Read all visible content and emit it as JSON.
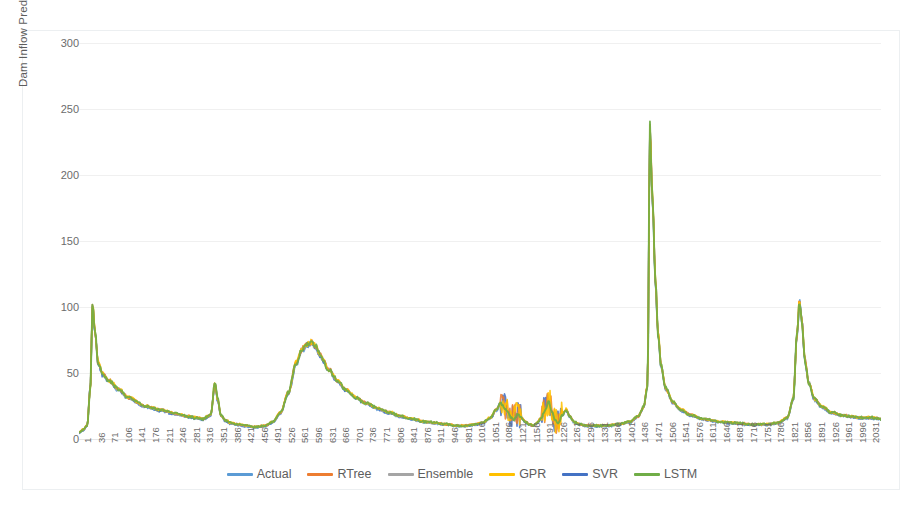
{
  "chart_data": {
    "type": "line",
    "title": "",
    "xlabel": "",
    "ylabel": "Dam Inflow Prediction (cubic meter /s)",
    "ylim": [
      0,
      300
    ],
    "yticks": [
      0,
      50,
      100,
      150,
      200,
      250,
      300
    ],
    "grid": true,
    "legend_position": "bottom",
    "xlim": [
      1,
      2066
    ],
    "xtick_step": 35,
    "xticks": [
      1,
      36,
      71,
      106,
      141,
      176,
      211,
      246,
      281,
      316,
      351,
      386,
      421,
      456,
      491,
      526,
      561,
      596,
      631,
      666,
      701,
      736,
      771,
      806,
      841,
      876,
      911,
      946,
      981,
      1016,
      1051,
      1086,
      1121,
      1156,
      1191,
      1226,
      1261,
      1296,
      1331,
      1366,
      1401,
      1436,
      1471,
      1506,
      1541,
      1576,
      1611,
      1646,
      1681,
      1716,
      1751,
      1786,
      1821,
      1856,
      1891,
      1926,
      1961,
      1996,
      2031
    ],
    "series": [
      {
        "name": "Actual",
        "color": "#5B9BD5"
      },
      {
        "name": "RTree",
        "color": "#ED7D31"
      },
      {
        "name": "Ensemble",
        "color": "#A5A5A5"
      },
      {
        "name": "GPR",
        "color": "#FFC000"
      },
      {
        "name": "SVR",
        "color": "#4472C4"
      },
      {
        "name": "LSTM",
        "color": "#70AD47"
      }
    ],
    "control_points": {
      "x": [
        1,
        12,
        22,
        30,
        36,
        42,
        50,
        62,
        80,
        100,
        130,
        170,
        210,
        250,
        281,
        300,
        320,
        340,
        351,
        358,
        366,
        378,
        392,
        410,
        430,
        456,
        480,
        500,
        520,
        540,
        561,
        575,
        590,
        600,
        610,
        625,
        645,
        666,
        690,
        715,
        740,
        771,
        800,
        830,
        860,
        890,
        920,
        946,
        975,
        1000,
        1020,
        1040,
        1060,
        1075,
        1086,
        1095,
        1105,
        1115,
        1121,
        1130,
        1140,
        1150,
        1160,
        1170,
        1180,
        1191,
        1200,
        1210,
        1220,
        1226,
        1235,
        1245,
        1255,
        1265,
        1275,
        1290,
        1310,
        1331,
        1360,
        1390,
        1420,
        1440,
        1455,
        1465,
        1471,
        1478,
        1485,
        1492,
        1500,
        1512,
        1530,
        1550,
        1576,
        1610,
        1650,
        1690,
        1730,
        1770,
        1800,
        1825,
        1840,
        1850,
        1856,
        1862,
        1870,
        1880,
        1895,
        1915,
        1940,
        1965,
        1990,
        2015,
        2040,
        2066
      ],
      "y": [
        5,
        7,
        10,
        38,
        103,
        82,
        58,
        49,
        44,
        38,
        31,
        25,
        22,
        19,
        17,
        16,
        15,
        18,
        42,
        30,
        18,
        14,
        12,
        11,
        10,
        9,
        10,
        13,
        20,
        35,
        58,
        68,
        72,
        73,
        70,
        62,
        52,
        44,
        37,
        31,
        27,
        23,
        20,
        17,
        15,
        13,
        12,
        11,
        10,
        10,
        11,
        12,
        16,
        22,
        27,
        24,
        20,
        16,
        14,
        19,
        16,
        13,
        11,
        10,
        12,
        16,
        21,
        28,
        20,
        14,
        12,
        18,
        22,
        17,
        13,
        11,
        10,
        10,
        10,
        11,
        13,
        17,
        24,
        40,
        235,
        180,
        120,
        80,
        55,
        38,
        28,
        22,
        18,
        15,
        13,
        12,
        11,
        11,
        12,
        16,
        30,
        80,
        105,
        90,
        60,
        42,
        30,
        24,
        20,
        18,
        17,
        16,
        16,
        15
      ]
    },
    "noise": {
      "band_amplitude": 2.2,
      "spike_regions": [
        [
          1086,
          1140
        ],
        [
          1191,
          1245
        ]
      ]
    }
  },
  "legend": {
    "items": [
      {
        "label": "Actual",
        "color": "#5B9BD5"
      },
      {
        "label": "RTree",
        "color": "#ED7D31"
      },
      {
        "label": "Ensemble",
        "color": "#A5A5A5"
      },
      {
        "label": "GPR",
        "color": "#FFC000"
      },
      {
        "label": "SVR",
        "color": "#4472C4"
      },
      {
        "label": "LSTM",
        "color": "#70AD47"
      }
    ]
  }
}
